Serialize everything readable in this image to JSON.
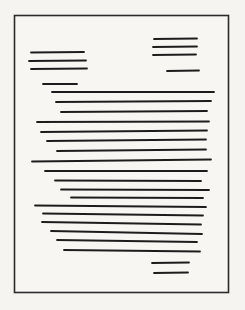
{
  "figure": {
    "type": "document-sketch",
    "canvas": {
      "width": 245,
      "height": 310,
      "background_color": "#f5f4f1"
    },
    "page_border": {
      "x": 14.5,
      "y": 15.5,
      "width": 214,
      "height": 277,
      "stroke_color": "#2a2a2a",
      "stroke_width": 1.6,
      "fill": "#f7f6f3"
    },
    "ink_color": "#1e1e1e",
    "stroke_width": 1.8,
    "blocks": [
      {
        "name": "header-right-block",
        "lines": [
          [
            154,
            39,
            197,
            38.5
          ],
          [
            153,
            47,
            197,
            46.5
          ],
          [
            153,
            55,
            196,
            54.5
          ]
        ]
      },
      {
        "name": "header-left-block",
        "lines": [
          [
            31,
            52.5,
            84,
            52
          ],
          [
            29,
            61,
            86,
            60.5
          ],
          [
            31,
            69,
            87,
            68.5
          ]
        ]
      },
      {
        "name": "date-line",
        "lines": [
          [
            167,
            71,
            199,
            70.5
          ]
        ]
      },
      {
        "name": "salutation-line",
        "lines": [
          [
            43,
            84,
            77,
            84
          ]
        ]
      },
      {
        "name": "body-paragraph",
        "lines": [
          [
            52,
            92,
            214,
            92
          ],
          [
            56,
            102,
            211,
            101
          ],
          [
            61,
            112,
            207,
            111
          ],
          [
            37,
            122,
            209,
            121.5
          ],
          [
            41,
            132,
            207,
            130.5
          ],
          [
            47,
            141,
            206,
            139.5
          ],
          [
            57,
            151,
            206,
            149.5
          ],
          [
            32,
            161.5,
            211,
            159.5
          ],
          [
            45,
            171,
            207,
            171
          ],
          [
            55,
            180.5,
            201,
            181
          ],
          [
            61,
            189.5,
            209,
            190
          ],
          [
            71,
            197.5,
            203,
            198
          ],
          [
            35,
            205.5,
            206,
            207
          ],
          [
            43,
            213.5,
            203,
            215.5
          ],
          [
            42,
            222,
            201,
            224.5
          ],
          [
            51,
            231,
            202,
            234
          ],
          [
            57,
            240,
            197,
            242
          ],
          [
            64,
            250,
            200,
            251.5
          ]
        ]
      },
      {
        "name": "signature-block",
        "lines": [
          [
            152,
            263,
            189,
            262.5
          ],
          [
            154,
            273,
            188,
            272.5
          ]
        ]
      }
    ]
  }
}
